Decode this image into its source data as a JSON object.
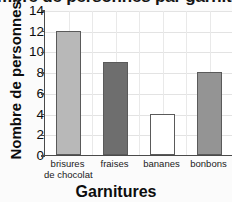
{
  "chart_data": {
    "type": "bar",
    "title": "Nombre de personnes par garniture",
    "title_cropped": true,
    "xlabel": "Garnitures",
    "ylabel": "Nombre de personnes",
    "categories": [
      "brisures de chocolat",
      "fraises",
      "bananes",
      "bonbons"
    ],
    "category_lines": [
      [
        "brisures",
        "de chocolat"
      ],
      [
        "fraises"
      ],
      [
        "bananes"
      ],
      [
        "bonbons"
      ]
    ],
    "values": [
      12,
      9,
      4,
      8
    ],
    "ylim": [
      0,
      14
    ],
    "yticks": [
      0,
      2,
      4,
      6,
      8,
      10,
      12,
      14
    ],
    "grid": true,
    "legend": "none",
    "bar_colors": [
      "#b8b8b8",
      "#6e6e6e",
      "#ffffff",
      "#949494"
    ],
    "bar_edge_color": "#5a5a5a",
    "grid_color": "#e3e3e3",
    "axis_color": "#4a4a4a",
    "text_color": "#0d0d0d",
    "plot_background": "#ffffff"
  }
}
